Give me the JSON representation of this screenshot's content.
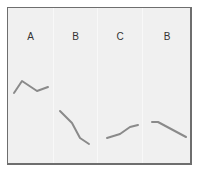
{
  "chart_data": {
    "type": "line",
    "title": "",
    "xlabel": "",
    "ylabel": "",
    "grid": false,
    "panels": [
      {
        "label": "A",
        "points": [
          [
            14,
            93
          ],
          [
            22,
            81
          ],
          [
            37,
            91
          ],
          [
            48,
            87
          ]
        ]
      },
      {
        "label": "B",
        "points": [
          [
            60,
            111
          ],
          [
            72,
            123
          ],
          [
            80,
            138
          ],
          [
            89,
            144
          ]
        ]
      },
      {
        "label": "C",
        "points": [
          [
            107,
            138
          ],
          [
            120,
            134
          ],
          [
            130,
            127
          ],
          [
            138,
            125
          ]
        ]
      },
      {
        "label": "B",
        "points": [
          [
            152,
            122
          ],
          [
            158,
            122
          ],
          [
            186,
            137
          ]
        ]
      }
    ],
    "line_color": "#8a8a8a",
    "background_color": "#f0f0f0"
  }
}
